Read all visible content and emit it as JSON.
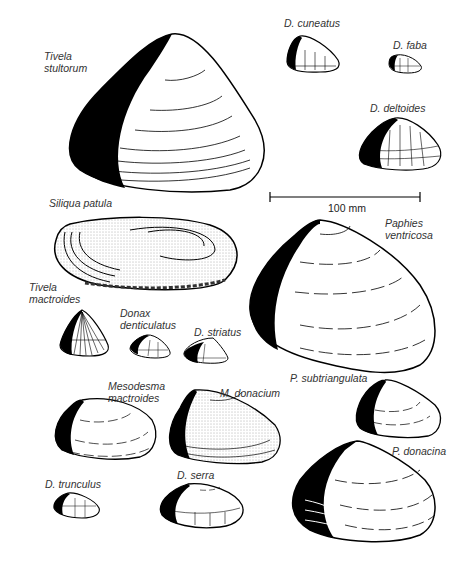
{
  "figure": {
    "scale_bar": {
      "label": "100 mm",
      "x1": 270,
      "x2": 420,
      "y": 197
    },
    "shells": [
      {
        "id": "tivela-stultorum",
        "label_lines": [
          "Tivela",
          "stultorum"
        ],
        "label_x": 44,
        "label_y": 50
      },
      {
        "id": "d-cuneatus",
        "label_lines": [
          "D. cuneatus"
        ],
        "label_x": 284,
        "label_y": 17
      },
      {
        "id": "d-faba",
        "label_lines": [
          "D. faba"
        ],
        "label_x": 393,
        "label_y": 39
      },
      {
        "id": "d-deltoides",
        "label_lines": [
          "D. deltoides"
        ],
        "label_x": 370,
        "label_y": 102
      },
      {
        "id": "siliqua-patula",
        "label_lines": [
          "Siliqua patula"
        ],
        "label_x": 49,
        "label_y": 197
      },
      {
        "id": "paphies-ventricosa",
        "label_lines": [
          "Paphies",
          "ventricosa"
        ],
        "label_x": 385,
        "label_y": 217
      },
      {
        "id": "tivela-mactroides",
        "label_lines": [
          "Tivela",
          "mactroides"
        ],
        "label_x": 29,
        "label_y": 281
      },
      {
        "id": "donax-denticulatus",
        "label_lines": [
          "Donax",
          "denticulatus"
        ],
        "label_x": 120,
        "label_y": 307
      },
      {
        "id": "d-striatus",
        "label_lines": [
          "D. striatus"
        ],
        "label_x": 194,
        "label_y": 326
      },
      {
        "id": "p-subtriangulata",
        "label_lines": [
          "P. subtriangulata"
        ],
        "label_x": 290,
        "label_y": 372
      },
      {
        "id": "mesodesma-mactroides",
        "label_lines": [
          "Mesodesma",
          "mactroides"
        ],
        "label_x": 108,
        "label_y": 380
      },
      {
        "id": "m-donacium",
        "label_lines": [
          "M. donacium"
        ],
        "label_x": 220,
        "label_y": 387
      },
      {
        "id": "p-donacina",
        "label_lines": [
          "P. donacina"
        ],
        "label_x": 392,
        "label_y": 445
      },
      {
        "id": "d-trunculus",
        "label_lines": [
          "D. trunculus"
        ],
        "label_x": 45,
        "label_y": 478
      },
      {
        "id": "d-serra",
        "label_lines": [
          "D. serra"
        ],
        "label_x": 177,
        "label_y": 469
      }
    ]
  },
  "scale": {
    "label": "100 mm"
  }
}
